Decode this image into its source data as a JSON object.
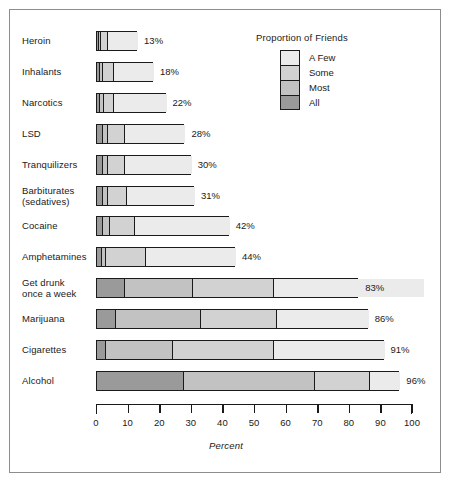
{
  "chart_data": {
    "type": "bar",
    "subtype": "horizontal-stacked-bar",
    "title": "",
    "xlabel": "Percent",
    "ylabel": "",
    "xlim": [
      0,
      100
    ],
    "grid": false,
    "legend_position": "top-right",
    "legend_title": "Proportion of Friends",
    "series_order_from_axis": [
      "All",
      "Most",
      "Some",
      "A Few"
    ],
    "series": [
      {
        "name": "All",
        "color": "#9a9a9a",
        "values": [
          0.6,
          0.8,
          1.0,
          2.0,
          2.0,
          2.0,
          2.0,
          1.5,
          9.0,
          6.0,
          3.0,
          27.5
        ]
      },
      {
        "name": "Most",
        "color": "#c2c2c2",
        "values": [
          0.7,
          1.2,
          1.2,
          1.5,
          1.5,
          1.5,
          2.0,
          1.5,
          21.5,
          27.0,
          21.0,
          41.5
        ]
      },
      {
        "name": "Some",
        "color": "#d2d2d2",
        "values": [
          2.2,
          3.5,
          3.3,
          5.5,
          5.5,
          6.0,
          8.0,
          12.5,
          25.5,
          24.0,
          32.0,
          17.5
        ]
      },
      {
        "name": "A Few",
        "color": "#ebebeb",
        "values": [
          9.5,
          12.5,
          16.5,
          19.0,
          21.0,
          21.5,
          30.0,
          28.5,
          47.5,
          29.0,
          35.0,
          9.5
        ]
      }
    ],
    "categories": [
      "Heroin",
      "Inhalants",
      "Narcotics",
      "LSD",
      "Tranquilizers",
      "Barbiturates\n(sedatives)",
      "Cocaine",
      "Amphetamines",
      "Get drunk\nonce a week",
      "Marijuana",
      "Cigarettes",
      "Alcohol"
    ],
    "totals": [
      13,
      18,
      22,
      28,
      30,
      31,
      42,
      44,
      83,
      86,
      91,
      96
    ],
    "total_labels": [
      "13%",
      "18%",
      "22%",
      "28%",
      "30%",
      "31%",
      "42%",
      "44%",
      "83%",
      "86%",
      "91%",
      "96%"
    ],
    "xticks": [
      0,
      10,
      20,
      30,
      40,
      50,
      60,
      70,
      80,
      90,
      100
    ],
    "xtick_labels": [
      "0",
      "10",
      "20",
      "30",
      "40",
      "50",
      "60",
      "70",
      "80",
      "90",
      "100"
    ]
  },
  "legend": {
    "title": "Proportion of Friends",
    "items": [
      {
        "label": "A Few",
        "color": "#ebebeb"
      },
      {
        "label": "Some",
        "color": "#d2d2d2"
      },
      {
        "label": "Most",
        "color": "#c2c2c2"
      },
      {
        "label": "All",
        "color": "#9a9a9a"
      }
    ]
  },
  "axis": {
    "xlabel": "Percent"
  },
  "colors": {
    "frame": "#8d8d8d",
    "ink": "#1a1a1a",
    "background": "#ffffff"
  }
}
